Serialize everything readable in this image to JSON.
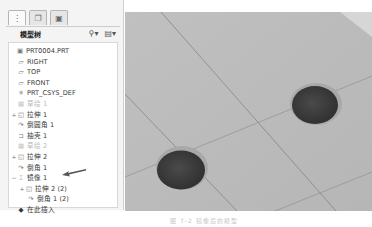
{
  "model_tree": {
    "tabs": [
      {
        "name": "model-tree-tab",
        "icon": "tree-icon",
        "active": true
      },
      {
        "name": "layers-tab",
        "icon": "layers-icon",
        "active": false
      },
      {
        "name": "folder-tab",
        "icon": "folder-icon",
        "active": false
      }
    ],
    "title": "模型树",
    "tools": [
      {
        "icon": "show-icon",
        "label": "⚲▾"
      },
      {
        "icon": "settings-icon",
        "label": "▤▾"
      }
    ],
    "items": [
      {
        "label": "PRT0004.PRT",
        "icon": "▣",
        "expander": "",
        "indent": 0,
        "dim": false
      },
      {
        "label": "RIGHT",
        "icon": "▱",
        "expander": "",
        "indent": 1,
        "dim": false
      },
      {
        "label": "TOP",
        "icon": "▱",
        "expander": "",
        "indent": 1,
        "dim": false
      },
      {
        "label": "FRONT",
        "icon": "▱",
        "expander": "",
        "indent": 1,
        "dim": false
      },
      {
        "label": "PRT_CSYS_DEF",
        "icon": "✳",
        "expander": "",
        "indent": 1,
        "dim": false
      },
      {
        "label": "草绘 1",
        "icon": "▦",
        "expander": "",
        "indent": 1,
        "dim": true
      },
      {
        "label": "拉伸 1",
        "icon": "◱",
        "expander": "+",
        "indent": 0,
        "dim": false
      },
      {
        "label": "倒圆角 1",
        "icon": "↷",
        "expander": "",
        "indent": 1,
        "dim": false
      },
      {
        "label": "抽壳 1",
        "icon": "⊐",
        "expander": "",
        "indent": 1,
        "dim": false
      },
      {
        "label": "草绘 2",
        "icon": "▦",
        "expander": "",
        "indent": 1,
        "dim": true
      },
      {
        "label": "拉伸 2",
        "icon": "◱",
        "expander": "+",
        "indent": 0,
        "dim": false
      },
      {
        "label": "倒角 1",
        "icon": "↷",
        "expander": "",
        "indent": 1,
        "dim": false
      },
      {
        "label": "镜像 1",
        "icon": "⌶",
        "expander": "−",
        "indent": 0,
        "dim": false
      },
      {
        "label": "拉伸 2 (2)",
        "icon": "◱",
        "expander": "+",
        "indent": 2,
        "dim": false
      },
      {
        "label": "倒角 1 (2)",
        "icon": "↷",
        "expander": "",
        "indent": 2,
        "dim": false
      },
      {
        "label": "在此插入",
        "icon": "◆",
        "expander": "",
        "indent": 1,
        "dim": false
      }
    ]
  },
  "viewport": {
    "background": "#b9b9b9",
    "hole_color": "#3e3e3e",
    "line_color": "#7f7f7f"
  },
  "caption": "图 7-2  镜像后的模型"
}
